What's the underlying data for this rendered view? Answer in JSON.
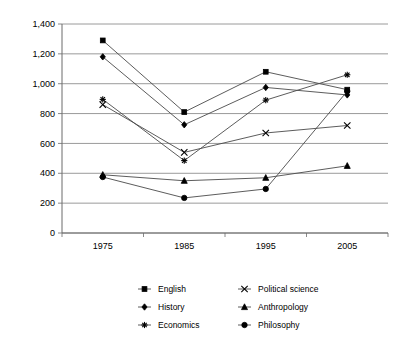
{
  "chart_data": {
    "type": "line",
    "title": "",
    "subtitle": "",
    "xlabel": "",
    "ylabel": "",
    "categories": [
      "1975",
      "1985",
      "1995",
      "2005"
    ],
    "x_tick_labels": [
      "1975",
      "1985",
      "1995",
      "2005"
    ],
    "y_tick_labels": [
      "0",
      "200",
      "400",
      "600",
      "800",
      "1,000",
      "1,200",
      "1,400"
    ],
    "y_tick_values": [
      0,
      200,
      400,
      600,
      800,
      1000,
      1200,
      1400
    ],
    "ylim": [
      0,
      1400
    ],
    "grid": "horizontal",
    "legend_position": "bottom",
    "series": [
      {
        "name": "English",
        "marker": "square",
        "values": [
          1290,
          810,
          1080,
          960
        ]
      },
      {
        "name": "History",
        "marker": "diamond",
        "values": [
          1180,
          725,
          975,
          925
        ]
      },
      {
        "name": "Economics",
        "marker": "star",
        "values": [
          895,
          485,
          890,
          1060
        ]
      },
      {
        "name": "Political science",
        "marker": "cross",
        "values": [
          860,
          540,
          670,
          720
        ]
      },
      {
        "name": "Anthropology",
        "marker": "triangle",
        "values": [
          390,
          350,
          370,
          450
        ]
      },
      {
        "name": "Philosophy",
        "marker": "circle",
        "values": [
          375,
          235,
          295,
          950
        ]
      }
    ],
    "colors": {
      "line": "#4a4a4a",
      "marker": "#000000",
      "grid": "#808080",
      "axis": "#6b6b6b",
      "background": "#ffffff"
    }
  },
  "legend": {
    "items": [
      {
        "label": "English",
        "marker": "square"
      },
      {
        "label": "Political science",
        "marker": "cross"
      },
      {
        "label": "History",
        "marker": "diamond"
      },
      {
        "label": "Anthropology",
        "marker": "triangle"
      },
      {
        "label": "Economics",
        "marker": "star"
      },
      {
        "label": "Philosophy",
        "marker": "circle"
      }
    ]
  }
}
